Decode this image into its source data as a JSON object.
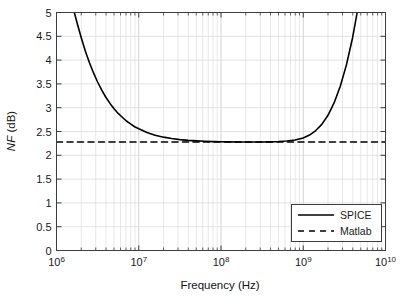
{
  "chart_data": {
    "type": "line",
    "title": "",
    "xlabel": "Frequency  (Hz)",
    "ylabel": "NF  (dB)",
    "ylabel_italic_part": "NF",
    "ylabel_rest": " (dB)",
    "xscale": "log",
    "yscale": "linear",
    "xlim": [
      1000000,
      10000000000
    ],
    "ylim": [
      0,
      5
    ],
    "grid": true,
    "grid_minor": true,
    "legend_position": "lower right",
    "x_tick_labels": [
      "10",
      "10",
      "10",
      "10",
      "10"
    ],
    "x_tick_exponents": [
      "6",
      "7",
      "8",
      "9",
      "10"
    ],
    "x_tick_values": [
      1000000,
      10000000,
      100000000,
      1000000000,
      10000000000
    ],
    "y_tick_labels": [
      "0",
      "0.5",
      "1",
      "1.5",
      "2",
      "2.5",
      "3",
      "3.5",
      "4",
      "4.5",
      "5"
    ],
    "y_tick_values": [
      0,
      0.5,
      1,
      1.5,
      2,
      2.5,
      3,
      3.5,
      4,
      4.5,
      5
    ],
    "series": [
      {
        "name": "SPICE",
        "style": "solid",
        "color": "#000000",
        "width": 1.6,
        "points": [
          [
            1000000.0,
            6.9
          ],
          [
            1120000.0,
            6.4
          ],
          [
            1260000.0,
            5.93
          ],
          [
            1410000.0,
            5.5
          ],
          [
            1580000.0,
            5.12
          ],
          [
            1780000.0,
            4.78
          ],
          [
            2000000.0,
            4.47
          ],
          [
            2240000.0,
            4.19
          ],
          [
            2510000.0,
            3.95
          ],
          [
            2820000.0,
            3.73
          ],
          [
            3160000.0,
            3.54
          ],
          [
            3550000.0,
            3.37
          ],
          [
            3980000.0,
            3.22
          ],
          [
            4470000.0,
            3.09
          ],
          [
            5010000.0,
            2.98
          ],
          [
            5620000.0,
            2.88
          ],
          [
            6310000.0,
            2.8
          ],
          [
            7080000.0,
            2.72
          ],
          [
            7940000.0,
            2.66
          ],
          [
            8910000.0,
            2.6
          ],
          [
            10000000.0,
            2.556
          ],
          [
            12600000.0,
            2.478
          ],
          [
            15800000.0,
            2.422
          ],
          [
            20000000.0,
            2.381
          ],
          [
            25100000.0,
            2.352
          ],
          [
            31600000.0,
            2.33
          ],
          [
            39800000.0,
            2.314
          ],
          [
            50100000.0,
            2.302
          ],
          [
            63100000.0,
            2.294
          ],
          [
            79400000.0,
            2.288
          ],
          [
            100000000.0,
            2.284
          ],
          [
            126000000.0,
            2.281
          ],
          [
            158000000.0,
            2.279
          ],
          [
            200000000.0,
            2.278
          ],
          [
            251000000.0,
            2.279
          ],
          [
            316000000.0,
            2.28
          ],
          [
            398000000.0,
            2.283
          ],
          [
            501000000.0,
            2.289
          ],
          [
            631000000.0,
            2.3
          ],
          [
            794000000.0,
            2.322
          ],
          [
            1000000000.0,
            2.365
          ],
          [
            1190000000.0,
            2.425
          ],
          [
            1410000000.0,
            2.515
          ],
          [
            1680000000.0,
            2.65
          ],
          [
            2000000000.0,
            2.84
          ],
          [
            2370000000.0,
            3.1
          ],
          [
            2820000000.0,
            3.45
          ],
          [
            3350000000.0,
            3.9
          ],
          [
            3980000000.0,
            4.47
          ],
          [
            4470000000.0,
            4.95
          ],
          [
            5010000000.0,
            5.52
          ],
          [
            5620000000.0,
            6.2
          ],
          [
            6310000000.0,
            7.0
          ],
          [
            7080000000.0,
            7.9
          ],
          [
            7940000000.0,
            8.9
          ],
          [
            8910000000.0,
            10.0
          ],
          [
            10000000000.0,
            11.2
          ]
        ]
      },
      {
        "name": "Matlab",
        "style": "dashed",
        "color": "#000000",
        "width": 1.6,
        "constant_value": 2.28,
        "points": [
          [
            1000000.0,
            2.28
          ],
          [
            10000000000.0,
            2.28
          ]
        ]
      }
    ],
    "legend_entries": [
      {
        "label": "SPICE",
        "style": "solid"
      },
      {
        "label": "Matlab",
        "style": "dashed"
      }
    ]
  },
  "axes": {
    "box_color": "#3d3d3d",
    "grid_color": "#d8d8d8",
    "background": "#ffffff"
  }
}
